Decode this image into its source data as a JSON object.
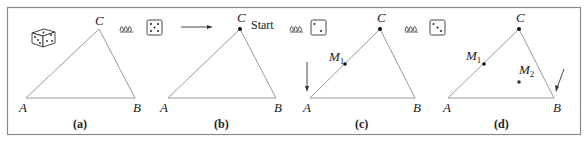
{
  "figure": {
    "border_color": "#8a8a8a",
    "line_color": "#9a9a9a",
    "panels": [
      {
        "caption": "(a)",
        "vertices": {
          "A": "A",
          "B": "B",
          "C": "C"
        },
        "icons": [
          "3d-die-icon"
        ]
      },
      {
        "caption": "(b)",
        "vertices": {
          "A": "A",
          "B": "B",
          "C": "C"
        },
        "start_label": "Start",
        "icons": [
          "spring-icon",
          "die-five-icon",
          "right-arrow-icon"
        ]
      },
      {
        "caption": "(c)",
        "vertices": {
          "A": "A",
          "B": "B",
          "C": "C"
        },
        "points": [
          {
            "name": "M",
            "sub": "1"
          }
        ],
        "icons": [
          "spring-icon",
          "die-two-icon",
          "down-arrow-icon"
        ]
      },
      {
        "caption": "(d)",
        "vertices": {
          "A": "A",
          "B": "B",
          "C": "C"
        },
        "points": [
          {
            "name": "M",
            "sub": "1"
          },
          {
            "name": "M",
            "sub": "2"
          }
        ],
        "icons": [
          "spring-icon",
          "die-three-icon",
          "down-left-arrow-icon"
        ]
      }
    ]
  }
}
